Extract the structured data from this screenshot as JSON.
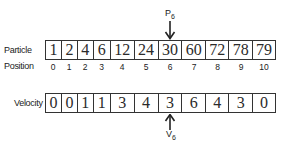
{
  "diagram": {
    "particle_row": {
      "label": "Particle",
      "values": [
        "1",
        "2",
        "4",
        "6",
        "12",
        "24",
        "30",
        "60",
        "72",
        "78",
        "79"
      ]
    },
    "position_row": {
      "label": "Position",
      "values": [
        "0",
        "1",
        "2",
        "3",
        "4",
        "5",
        "6",
        "7",
        "8",
        "9",
        "10"
      ]
    },
    "velocity_row": {
      "label": "Velocity",
      "values": [
        "0",
        "0",
        "1",
        "1",
        "3",
        "4",
        "3",
        "6",
        "4",
        "3",
        "0"
      ]
    },
    "particle_pointer": {
      "letter": "P",
      "subscript": "6",
      "index": 6
    },
    "velocity_pointer": {
      "letter": "V",
      "subscript": "6",
      "index": 6
    },
    "colors": {
      "line": "#333333",
      "text": "#2a2a2a",
      "background": "#ffffff"
    }
  }
}
